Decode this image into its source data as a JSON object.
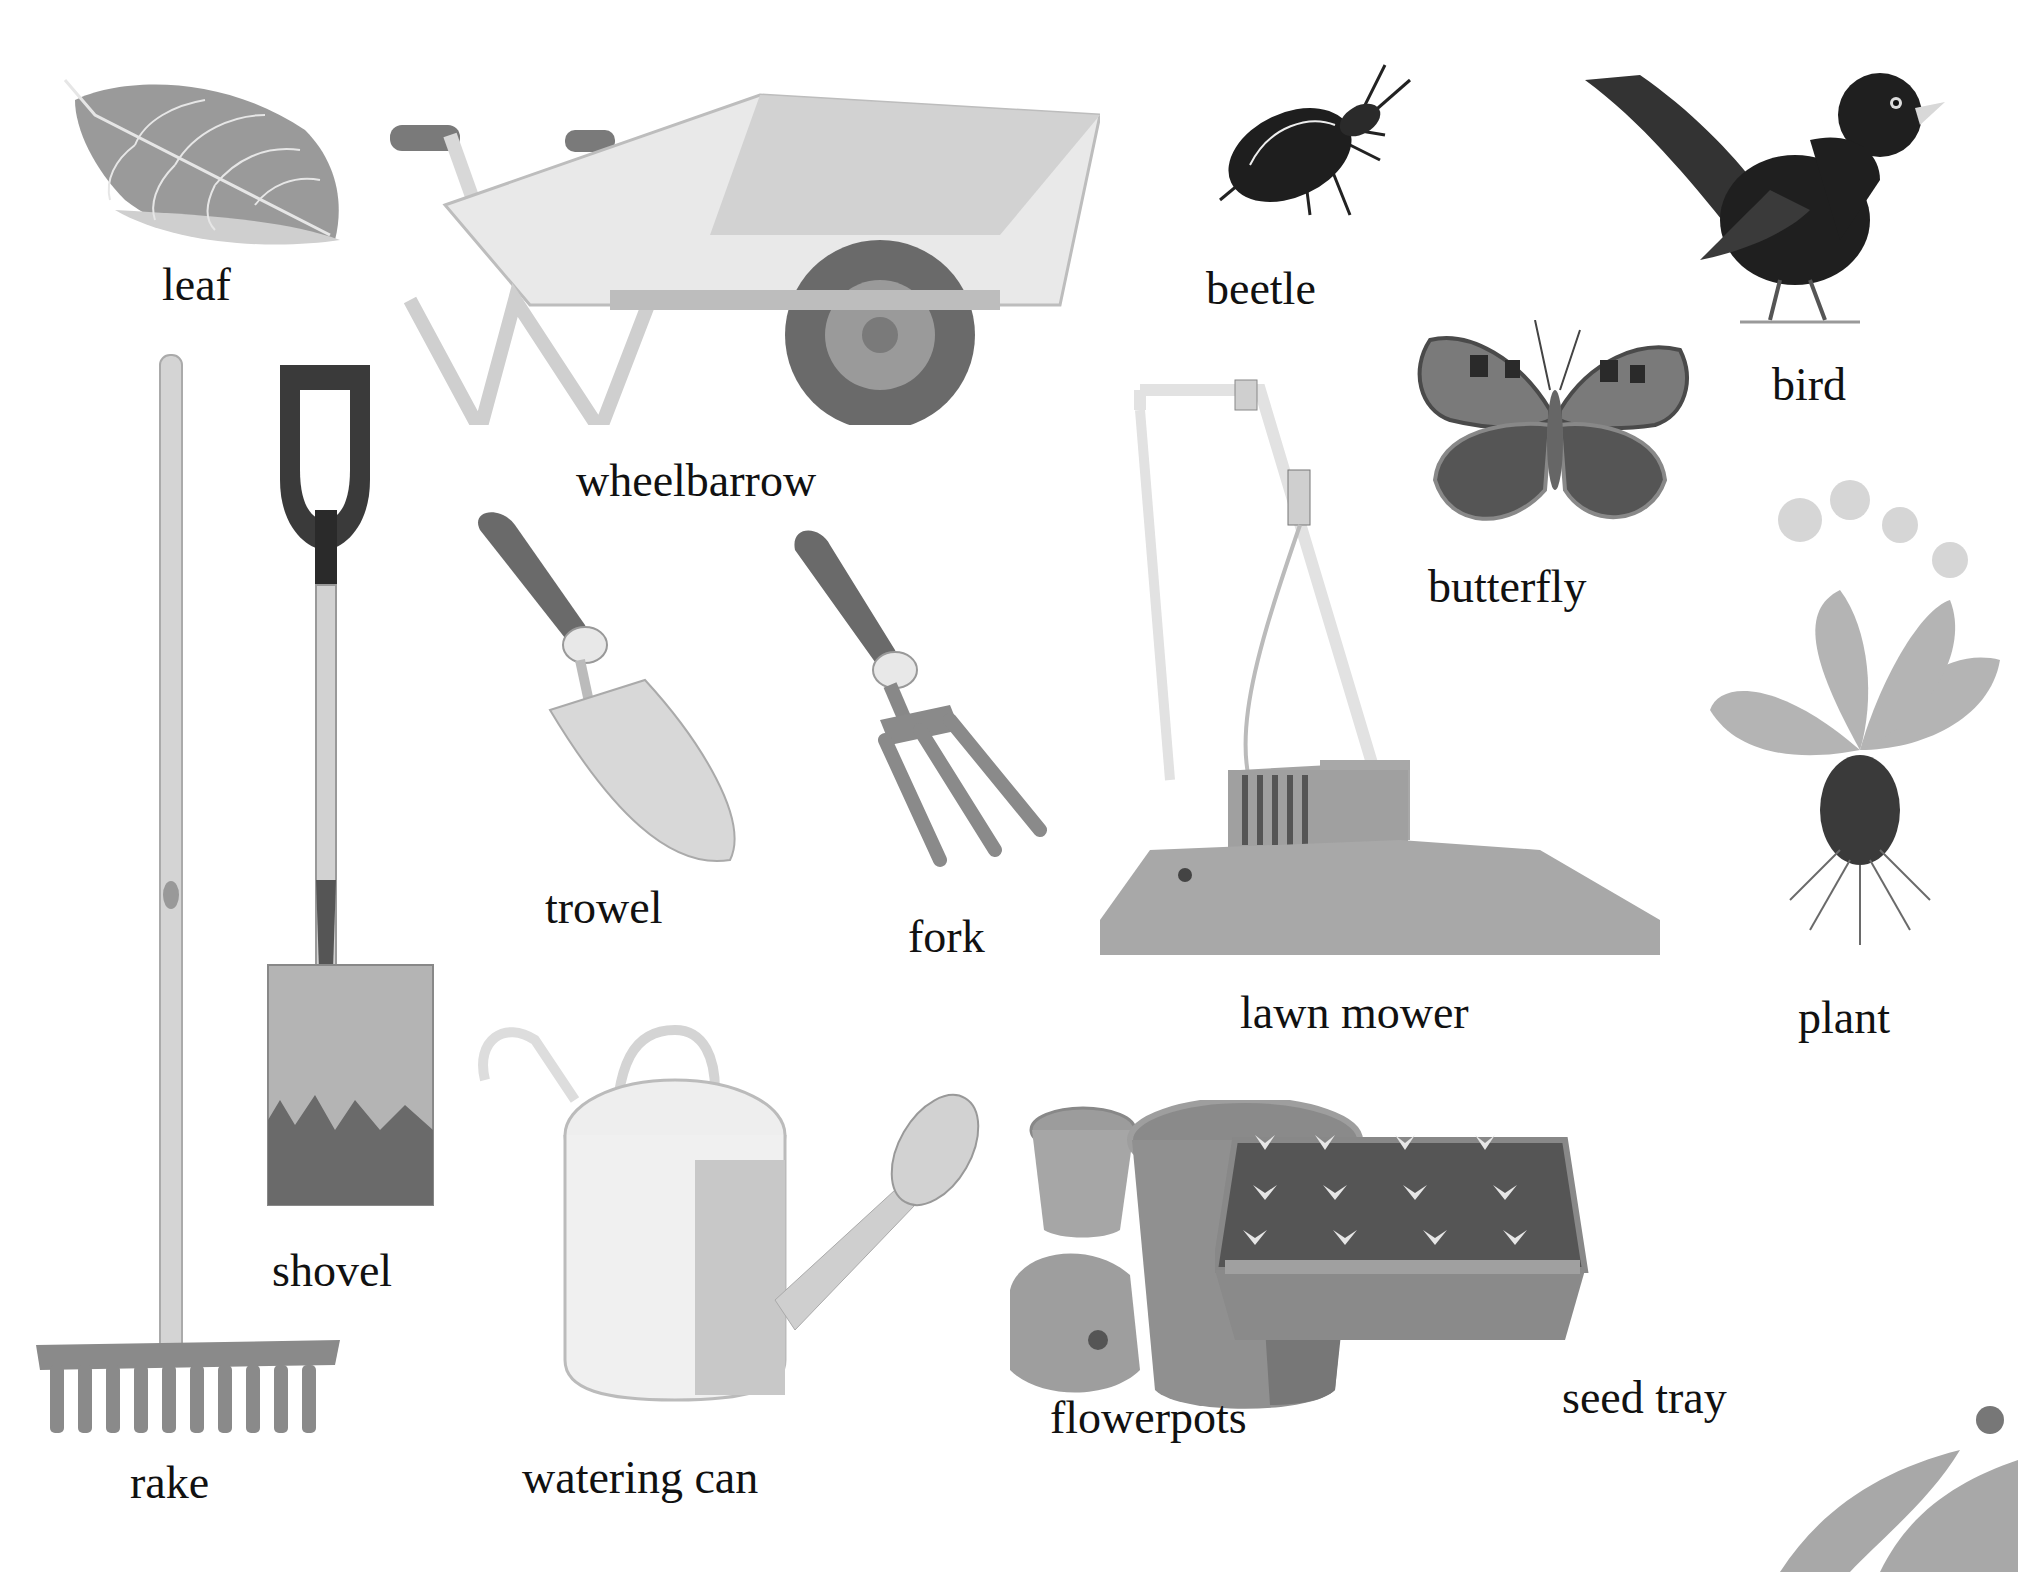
{
  "page": {
    "theme": "garden vocabulary",
    "palette": {
      "background": "#ffffff",
      "text": "#111111",
      "ink_dark": "#2a2a2a",
      "mid": "#8a8a8a",
      "light": "#c8c8c8"
    }
  },
  "items": [
    {
      "id": "leaf",
      "label": "leaf"
    },
    {
      "id": "wheelbarrow",
      "label": "wheelbarrow"
    },
    {
      "id": "beetle",
      "label": "beetle"
    },
    {
      "id": "bird",
      "label": "bird"
    },
    {
      "id": "butterfly",
      "label": "butterfly"
    },
    {
      "id": "rake",
      "label": "rake"
    },
    {
      "id": "shovel",
      "label": "shovel"
    },
    {
      "id": "trowel",
      "label": "trowel"
    },
    {
      "id": "fork",
      "label": "fork"
    },
    {
      "id": "lawn_mower",
      "label": "lawn mower"
    },
    {
      "id": "plant",
      "label": "plant"
    },
    {
      "id": "watering_can",
      "label": "watering can"
    },
    {
      "id": "flowerpots",
      "label": "flowerpots"
    },
    {
      "id": "seed_tray",
      "label": "seed tray"
    }
  ]
}
